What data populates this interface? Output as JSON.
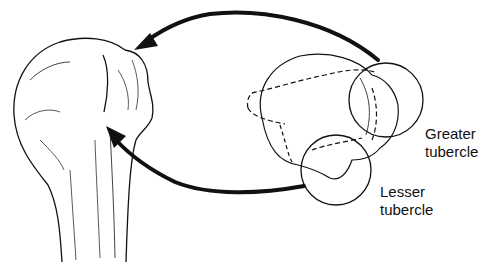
{
  "diagram": {
    "labels": {
      "greater_line1": "Greater",
      "greater_line2": "tubercle",
      "lesser_line1": "Lesser",
      "lesser_line2": "tubercle"
    },
    "colors": {
      "ink": "#111111",
      "background": "#ffffff"
    }
  }
}
